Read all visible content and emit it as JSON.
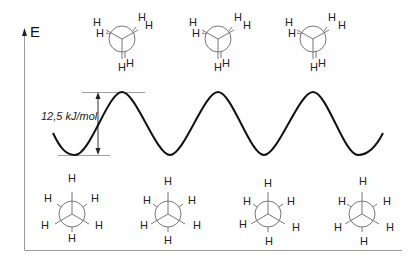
{
  "diagram": {
    "type": "energy-profile",
    "axis": {
      "y_label": "E"
    },
    "energy_barrier": {
      "label": "12,5 kJ/mol",
      "value": 12.5,
      "unit": "kJ/mol"
    },
    "curve": {
      "shape": "sinusoid",
      "minima_x_px": [
        75,
        170,
        263,
        357
      ],
      "maxima_x_px": [
        122,
        218,
        313
      ],
      "max_y_px": 92,
      "min_y_px": 155
    },
    "top_row": {
      "description": "eclipsed conformations (energy maxima)",
      "count": 3,
      "atom_label": "H"
    },
    "bottom_row": {
      "description": "staggered conformations (energy minima)",
      "count": 4,
      "atom_label": "H"
    },
    "colors": {
      "curve": "#111111",
      "lines": "#777777",
      "text": "#222222"
    }
  }
}
